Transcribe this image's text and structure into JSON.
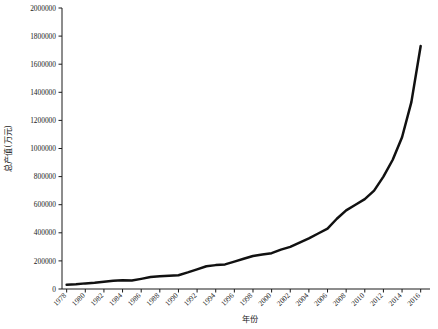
{
  "chart_data": {
    "type": "line",
    "title": "",
    "xlabel": "年份",
    "ylabel": "总产值(万元)",
    "xlim": [
      1977.5,
      2017.0
    ],
    "ylim": [
      0,
      2000000
    ],
    "grid": false,
    "legend": "none",
    "y_ticks": [
      0,
      200000,
      400000,
      600000,
      800000,
      1000000,
      1200000,
      1400000,
      1600000,
      1800000,
      2000000
    ],
    "y_tick_labels": [
      "0",
      "200000",
      "400000",
      "600000",
      "800000",
      "1000000",
      "1200000",
      "1400000",
      "1600000",
      "1800000",
      "2000000"
    ],
    "x_ticks": [
      1978,
      1980,
      1982,
      1984,
      1986,
      1988,
      1990,
      1992,
      1994,
      1996,
      1998,
      2000,
      2002,
      2004,
      2006,
      2008,
      2010,
      2012,
      2014,
      2016
    ],
    "x_tick_labels": [
      "1978",
      "1980",
      "1982",
      "1984",
      "1986",
      "1988",
      "1990",
      "1992",
      "1994",
      "1996",
      "1998",
      "2000",
      "2002",
      "2004",
      "2006",
      "2008",
      "2010",
      "2012",
      "2014",
      "2016"
    ],
    "x_tick_rotation": -45,
    "series": [
      {
        "name": "总产值",
        "color": "#111111",
        "x": [
          1978,
          1979,
          1980,
          1981,
          1982,
          1983,
          1984,
          1985,
          1986,
          1987,
          1988,
          1989,
          1990,
          1991,
          1992,
          1993,
          1994,
          1995,
          1996,
          1997,
          1998,
          1999,
          2000,
          2001,
          2002,
          2003,
          2004,
          2005,
          2006,
          2007,
          2008,
          2009,
          2010,
          2011,
          2012,
          2013,
          2014,
          2015,
          2016
        ],
        "y": [
          30000,
          33000,
          40000,
          45000,
          52000,
          58000,
          62000,
          60000,
          72000,
          85000,
          90000,
          95000,
          98000,
          118000,
          140000,
          162000,
          170000,
          175000,
          195000,
          215000,
          235000,
          245000,
          255000,
          280000,
          300000,
          330000,
          360000,
          395000,
          430000,
          500000,
          560000,
          600000,
          640000,
          700000,
          800000,
          920000,
          1080000,
          1330000,
          1730000
        ]
      }
    ]
  },
  "geometry": {
    "plot_left": 62,
    "plot_right": 430,
    "plot_top": 8,
    "plot_bottom": 289
  }
}
